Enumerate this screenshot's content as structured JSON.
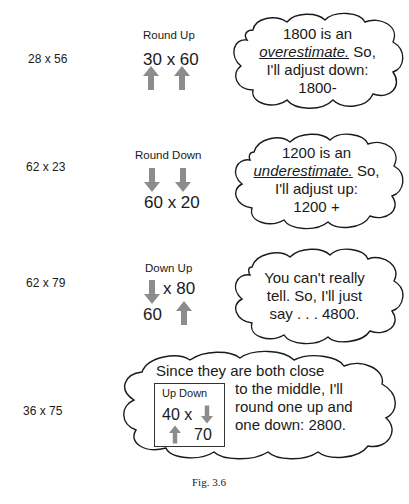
{
  "figure": {
    "caption": "Fig. 3.6",
    "arrow_color": "#8c8c8c",
    "rows": [
      {
        "problem": "28 x 56",
        "strategy_label": "Round Up",
        "rounded": "30 x 60",
        "arrows": [
          "up",
          "up"
        ],
        "thought": {
          "line1": "1800 is an",
          "emphasis": "overestimate.",
          "line2_rest": " So,",
          "line3": "I'll adjust down:",
          "line4": "1800-"
        }
      },
      {
        "problem": "62 x 23",
        "strategy_label": "Round Down",
        "rounded": "60 x 20",
        "arrows": [
          "down",
          "down"
        ],
        "thought": {
          "line1": "1200 is an",
          "emphasis": "underestimate.",
          "line2_rest": " So,",
          "line3": "I'll adjust up:",
          "line4": "1200 +"
        }
      },
      {
        "problem": "62 x 79",
        "strategy_label": "Down Up",
        "first": "60",
        "times_second": "x 80",
        "arrows": [
          "down",
          "up"
        ],
        "thought": {
          "line1": "You can't really",
          "line2": "tell. So, I'll just",
          "line3": "say . . . 4800."
        }
      },
      {
        "problem": "36 x 75",
        "thought": {
          "line1": "Since they are both close",
          "line2": "to the middle, I'll",
          "line3": "round one up and",
          "line4": "one down: 2800."
        },
        "inset": {
          "label": "Up Down",
          "first_times": "40 x",
          "second": "70",
          "arrows": [
            "up",
            "down"
          ]
        }
      }
    ]
  }
}
